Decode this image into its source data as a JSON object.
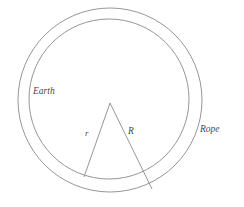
{
  "figure": {
    "background_color": "#ffffff",
    "stroke_color": "#8a8a8a",
    "label_color": "#4a4a4a",
    "stroke_width": 0.9
  },
  "labels": {
    "earth": "Earth",
    "rope": "Rope",
    "radius_small": "r",
    "radius_large": "R"
  },
  "chart_data": {
    "type": "diagram",
    "shapes": [
      {
        "name": "rope-circle",
        "kind": "circle",
        "label": "Rope",
        "cx": 110,
        "cy": 100,
        "r": 92,
        "fill": "none",
        "stroke": "#8a8a8a"
      },
      {
        "name": "earth-circle",
        "kind": "circle",
        "label": "Earth",
        "cx": 109,
        "cy": 99,
        "r": 80,
        "fill": "none",
        "stroke": "#8a8a8a"
      },
      {
        "name": "radius-r-line",
        "kind": "line",
        "label": "r",
        "x1": 110,
        "y1": 103,
        "x2": 84,
        "y2": 177,
        "stroke": "#8a8a8a"
      },
      {
        "name": "radius-R-line",
        "kind": "line",
        "label": "R",
        "x1": 110,
        "y1": 103,
        "x2": 152,
        "y2": 189,
        "stroke": "#8a8a8a"
      }
    ],
    "annotations": [
      {
        "text": "Earth",
        "x": 33,
        "y": 95,
        "style": "italic"
      },
      {
        "text": "Rope",
        "x": 200,
        "y": 133,
        "style": "italic"
      },
      {
        "text": "r",
        "x": 85,
        "y": 137,
        "style": "italic"
      },
      {
        "text": "R",
        "x": 128,
        "y": 136,
        "style": "italic"
      }
    ]
  }
}
